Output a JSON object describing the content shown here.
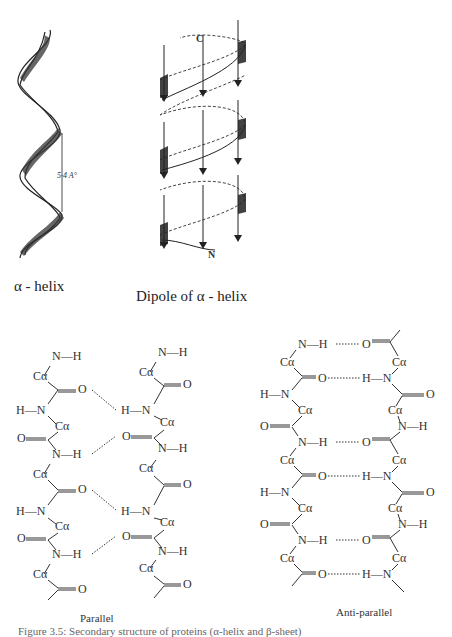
{
  "figures": {
    "alpha_helix": {
      "label": "α - helix",
      "pitch_annotation": "5·4 A°"
    },
    "dipole": {
      "label": "Dipole of α - helix",
      "c_terminus": "C",
      "n_terminus": "N"
    },
    "parallel_sheet": {
      "label": "Parallel",
      "atoms": {
        "ca": "Cα",
        "n": "N",
        "h": "H",
        "o": "O"
      }
    },
    "antiparallel_sheet": {
      "label": "Anti-parallel",
      "atoms": {
        "ca": "Cα",
        "n": "N",
        "h": "H",
        "o": "O"
      }
    }
  },
  "caption": "Figure 3.5: Secondary structure of proteins (α-helix and β-sheet)"
}
